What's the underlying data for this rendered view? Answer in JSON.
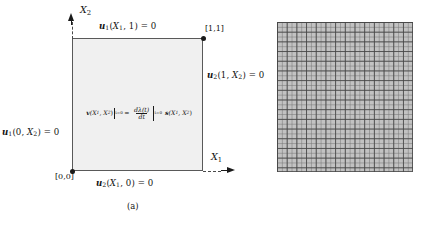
{
  "figure": {
    "panel_a": {
      "caption": "(a)",
      "axes": {
        "x1_label": "X",
        "x1_sub": "1",
        "x2_label": "X",
        "x2_sub": "2"
      },
      "corner_labels": {
        "top_right": "[1,1]",
        "bottom_left": "[0,0]"
      },
      "boundary_conditions": [
        {
          "position": "top",
          "symbol": "u",
          "symbol_sub": "2",
          "text": "u1(X1, 1) = 0",
          "args_open": "(",
          "arg1": "X",
          "arg1_sub": "1",
          "arg_sep": ", ",
          "arg2": "1",
          "args_close": ")",
          "equals": " = 0",
          "field_sub": "1"
        },
        {
          "position": "right",
          "text": "u2(1, X2) = 0",
          "field_sub": "2",
          "arg1": "1",
          "arg2": "X",
          "arg2_sub": "2"
        },
        {
          "position": "left",
          "text": "u1(0, X2) = 0",
          "field_sub": "1",
          "arg1": "0",
          "arg2": "X",
          "arg2_sub": "2"
        },
        {
          "position": "bottom",
          "text": "u2(X1, 0) = 0",
          "field_sub": "2",
          "arg1": "X",
          "arg1_sub": "1",
          "arg2": "0"
        }
      ],
      "center_equation": {
        "lhs_symbol": "v",
        "lhs_args": "(X",
        "lhs_sub1": "1",
        "lhs_mid": ", X",
        "lhs_sub2": "2",
        "lhs_close": ")",
        "lhs_eval": "t=0",
        "equals": "=",
        "numerator": "dλ(t)",
        "denominator": "dt",
        "frac_eval": "t=0",
        "rhs_symbol": "s",
        "rhs_args": "(X",
        "rhs_sub1": "1",
        "rhs_mid": ", X",
        "rhs_sub2": "2",
        "rhs_close": ")"
      },
      "domain": {
        "fill_color": "#f0f0f0",
        "border_color": "#595959"
      }
    },
    "panel_b": {
      "caption": "(b)",
      "mesh": {
        "fill_color": "#c2c2c2",
        "line_color": "#464646",
        "major_divisions": 14,
        "minor_divisions": 28
      }
    }
  }
}
